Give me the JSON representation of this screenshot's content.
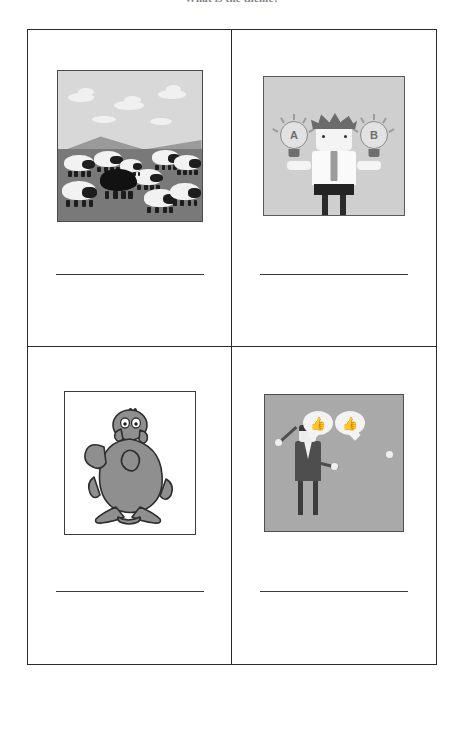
{
  "worksheet": {
    "title": "What is the theme?",
    "answer_line_placeholder": ""
  },
  "grid": {
    "rows": 2,
    "columns": 2,
    "cells": [
      {
        "id": "cell-1",
        "position": "top-left",
        "image": {
          "name": "black-sheep-illustration",
          "alt": "A flock of white sheep in a field with one black sheep in the middle",
          "subject": "black sheep",
          "background_sky_color": "#d8d8d8",
          "hill_color": "#9a9a9a",
          "field_color": "#797979",
          "white_sheep_count": 9,
          "black_sheep_count": 1
        },
        "answer": ""
      },
      {
        "id": "cell-2",
        "position": "top-right",
        "image": {
          "name": "ab-choice-illustration",
          "alt": "A cartoon businessman holding two lightbulbs labelled A and B",
          "subject": "decision between option A and option B",
          "background_color": "#cfcfcf",
          "bulb_left_label": "A",
          "bulb_right_label": "B"
        },
        "answer": ""
      },
      {
        "id": "cell-3",
        "position": "bottom-left",
        "image": {
          "name": "nervous-chicken-illustration",
          "alt": "A cartoon chicken standing with wings clasped looking scared",
          "subject": "chicken",
          "background_color": "#ffffff",
          "body_color": "#8c8c8c"
        },
        "answer": ""
      },
      {
        "id": "cell-4",
        "position": "bottom-right",
        "image": {
          "name": "handshake-agreement-illustration",
          "alt": "Two businessmen shaking hands with thumbs-up speech bubbles",
          "subject": "agreement / handshake",
          "background_color": "#a9a9a9",
          "bubble_icon": "thumbs-up",
          "bubble_glyph": "ὄD"
        },
        "answer": ""
      }
    ]
  },
  "style": {
    "page_background": "#ffffff",
    "table_border_color": "#2b2b2b",
    "answer_line_color": "#3a3a3a",
    "title_color": "#5d5d66"
  }
}
